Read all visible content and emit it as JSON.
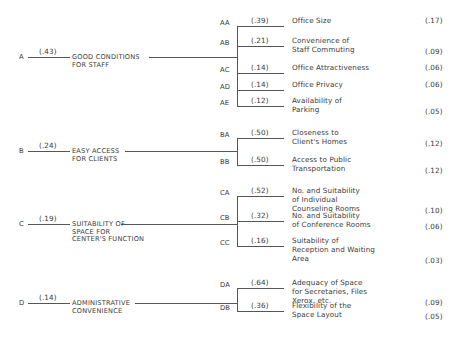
{
  "groups": [
    {
      "id": "A",
      "weight": "(.43)",
      "label_lines": [
        "GOOD CONDITIONS",
        "FOR STAFF"
      ],
      "children": [
        {
          "code": "AA",
          "local_weight": "(.39)",
          "label_lines": [
            "Office Size"
          ],
          "global_weight": "(.17)"
        },
        {
          "code": "AB",
          "local_weight": "(.21)",
          "label_lines": [
            "Convenience of",
            "Staff Commuting"
          ],
          "global_weight": "(.09)"
        },
        {
          "code": "AC",
          "local_weight": "(.14)",
          "label_lines": [
            "Office Attractiveness"
          ],
          "global_weight": "(.06)"
        },
        {
          "code": "AD",
          "local_weight": "(.14)",
          "label_lines": [
            "Office Privacy"
          ],
          "global_weight": "(.06)"
        },
        {
          "code": "AE",
          "local_weight": "(.12)",
          "label_lines": [
            "Availability of",
            "Parking"
          ],
          "global_weight": "(.05)"
        }
      ]
    },
    {
      "id": "B",
      "weight": "(.24)",
      "label_lines": [
        "EASY ACCESS",
        "FOR CLIENTS"
      ],
      "children": [
        {
          "code": "BA",
          "local_weight": "(.50)",
          "label_lines": [
            "Closeness to",
            "Client's Homes"
          ],
          "global_weight": "(.12)"
        },
        {
          "code": "BB",
          "local_weight": "(.50)",
          "label_lines": [
            "Access to Public",
            "Transportation"
          ],
          "global_weight": "(.12)"
        }
      ]
    },
    {
      "id": "C",
      "weight": "(.19)",
      "label_lines": [
        "SUITABILITY OF",
        "SPACE FOR",
        "CENTER'S FUNCTION"
      ],
      "children": [
        {
          "code": "CA",
          "local_weight": "(.52)",
          "label_lines": [
            "No. and Suitability",
            "of Individual",
            "Counseling Rooms"
          ],
          "global_weight": "(.10)"
        },
        {
          "code": "CB",
          "local_weight": "(.32)",
          "label_lines": [
            "No. and Suitability",
            "of Conference Rooms"
          ],
          "global_weight": "(.06)"
        },
        {
          "code": "CC",
          "local_weight": "(.16)",
          "label_lines": [
            "Suitability of",
            "Reception and Waiting",
            "Area"
          ],
          "global_weight": "(.03)"
        }
      ]
    },
    {
      "id": "D",
      "weight": "(.14)",
      "label_lines": [
        "ADMINISTRATIVE",
        "CONVENIENCE"
      ],
      "children": [
        {
          "code": "DA",
          "local_weight": "(.64)",
          "label_lines": [
            "Adequacy of Space",
            "for Secretaries, Files",
            "Xerox, etc."
          ],
          "global_weight": "(.09)"
        },
        {
          "code": "DB",
          "local_weight": "(.36)",
          "label_lines": [
            "Flexibility of the",
            "Space Layout"
          ],
          "global_weight": "(.05)"
        }
      ]
    }
  ]
}
